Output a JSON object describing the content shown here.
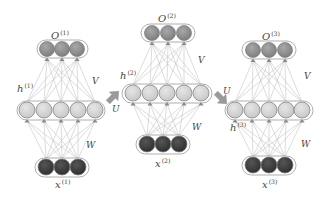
{
  "diagram": {
    "type": "unrolled-recurrent-neural-network",
    "colors": {
      "output_node": "#8a8a8a",
      "hidden_node": "#d2d2d2",
      "input_node": "#3c3c3c",
      "edge": "#c4c4c4",
      "node_stroke": "#7a7a7a",
      "arrow": "#9a9a9a",
      "label": "#444444"
    },
    "networks": [
      {
        "id": "t1",
        "output": {
          "label": "O",
          "sup": "(1)",
          "label_pos": [
            51,
            39
          ],
          "y": 49,
          "xs": [
            47,
            62,
            77
          ],
          "r": 7.5,
          "box": [
            37,
            40,
            51,
            18
          ]
        },
        "hidden": {
          "label": "h",
          "sup": "(1)",
          "label_pos": [
            17,
            92
          ],
          "y": 110,
          "xs": [
            27,
            44,
            61,
            78,
            95
          ],
          "r": 8,
          "box": [
            17,
            101,
            88,
            19
          ]
        },
        "input": {
          "label": "x",
          "sup": "(1)",
          "label_pos": [
            55,
            188
          ],
          "y": 167,
          "xs": [
            46,
            62,
            78
          ],
          "r": 8,
          "box": [
            35,
            158,
            54,
            19
          ]
        },
        "V": {
          "label": "V",
          "pos": [
            92,
            84
          ]
        },
        "W": {
          "label": "W",
          "pos": [
            86,
            148
          ]
        }
      },
      {
        "id": "t2",
        "output": {
          "label": "O",
          "sup": "(2)",
          "label_pos": [
            158,
            22
          ],
          "y": 33,
          "xs": [
            152,
            168,
            184
          ],
          "r": 7.5,
          "box": [
            141,
            24,
            54,
            18
          ]
        },
        "hidden": {
          "label": "h",
          "sup": "(2)",
          "label_pos": [
            120,
            79
          ],
          "y": 93,
          "xs": [
            133,
            150,
            167,
            184,
            201
          ],
          "r": 8,
          "box": [
            122,
            84,
            90,
            19
          ]
        },
        "input": {
          "label": "x",
          "sup": "(2)",
          "label_pos": [
            155,
            167
          ],
          "y": 144,
          "xs": [
            147,
            163,
            179
          ],
          "r": 8,
          "box": [
            136,
            135,
            54,
            19
          ]
        },
        "V": {
          "label": "V",
          "pos": [
            198,
            63
          ]
        },
        "W": {
          "label": "W",
          "pos": [
            192,
            130
          ]
        }
      },
      {
        "id": "t3",
        "output": {
          "label": "O",
          "sup": "(3)",
          "label_pos": [
            262,
            40
          ],
          "y": 50,
          "xs": [
            253,
            269,
            285
          ],
          "r": 7.5,
          "box": [
            242,
            41,
            54,
            18
          ]
        },
        "hidden": {
          "label": "h",
          "sup": "(3)",
          "label_pos": [
            230,
            131
          ],
          "y": 110,
          "xs": [
            235,
            252,
            269,
            286,
            302
          ],
          "r": 8,
          "box": [
            225,
            101,
            88,
            19
          ]
        },
        "input": {
          "label": "x",
          "sup": "(3)",
          "label_pos": [
            262,
            188
          ],
          "y": 165,
          "xs": [
            253,
            269,
            285
          ],
          "r": 8,
          "box": [
            242,
            156,
            54,
            19
          ]
        },
        "V": {
          "label": "V",
          "pos": [
            304,
            79
          ]
        },
        "W": {
          "label": "W",
          "pos": [
            301,
            147
          ]
        }
      }
    ],
    "recurrent_arrows": [
      {
        "label": "U",
        "from": "h(1)",
        "to": "h(2)",
        "direction": "up-right",
        "arrow_pos": [
          113,
          97
        ],
        "label_pos": [
          112,
          112
        ]
      },
      {
        "label": "U",
        "from": "h(2)",
        "to": "h(3)",
        "direction": "down-right",
        "arrow_pos": [
          221,
          98
        ],
        "label_pos": [
          223,
          94
        ]
      }
    ]
  }
}
